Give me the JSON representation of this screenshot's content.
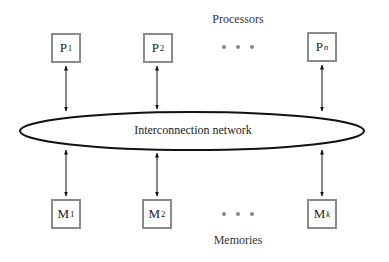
{
  "diagram": {
    "title_top": "Processors",
    "title_bottom": "Memories",
    "network_label": "Interconnection network",
    "processors": [
      {
        "base": "P",
        "sub": "1",
        "italic": false
      },
      {
        "base": "P",
        "sub": "2",
        "italic": false
      },
      {
        "base": "P",
        "sub": "n",
        "italic": true
      }
    ],
    "memories": [
      {
        "base": "M",
        "sub": "1",
        "italic": false
      },
      {
        "base": "M",
        "sub": "2",
        "italic": false
      },
      {
        "base": "M",
        "sub": "k",
        "italic": true
      }
    ],
    "ellipsis": "• • •",
    "colors": {
      "box_border": "#8a8a8a",
      "line": "#111111",
      "dots": "#888888"
    }
  }
}
